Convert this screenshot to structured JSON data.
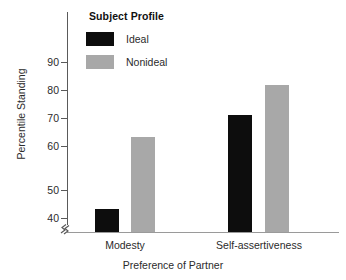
{
  "chart_data": {
    "type": "bar",
    "title": "",
    "subtitle": "",
    "xlabel": "Preference of Partner",
    "ylabel": "Percentile Standing",
    "categories": [
      "Modesty",
      "Self-assertiveness"
    ],
    "series": [
      {
        "name": "Ideal",
        "color": "#0d0d0d",
        "values": [
          43,
          73
        ]
      },
      {
        "name": "Nonideal",
        "color": "#a8a8a8",
        "values": [
          66,
          82.5
        ]
      }
    ],
    "ylim": [
      38,
      93
    ],
    "yticks": [
      40,
      50,
      60,
      70,
      80,
      90
    ],
    "ytick_labels": [
      "40",
      "50",
      "60",
      "70",
      "80",
      "90"
    ],
    "axis_break": true,
    "axis_break_note": "y-axis broken below 40",
    "grid": false,
    "legend": {
      "title": "Subject Profile",
      "position": "upper-left-inside",
      "entries": [
        {
          "label": "Ideal",
          "color": "#0d0d0d"
        },
        {
          "label": "Nonideal",
          "color": "#a8a8a8"
        }
      ]
    }
  },
  "axes": {
    "y_title": "Percentile Standing",
    "x_title": "Preference of Partner",
    "y_ticks": [
      "90",
      "80",
      "70",
      "60",
      "50",
      "40"
    ],
    "x_groups": [
      "Modesty",
      "Self-assertiveness"
    ]
  },
  "legend": {
    "title": "Subject Profile",
    "item_ideal": "Ideal",
    "item_nonideal": "Nonideal"
  },
  "colors": {
    "ideal": "#0d0d0d",
    "nonideal": "#a8a8a8",
    "axis": "#5a5a5a",
    "text": "#2b2b2b",
    "background": "#ffffff"
  }
}
